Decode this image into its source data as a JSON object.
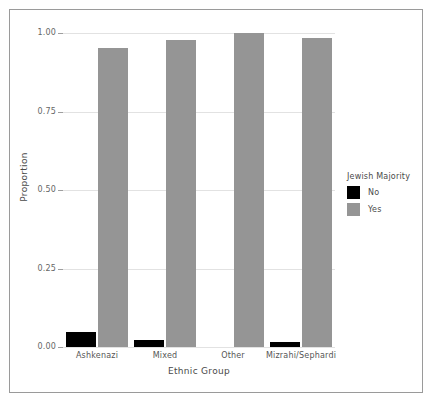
{
  "chart_data": {
    "type": "bar",
    "title": "",
    "subtitle": "",
    "xlabel": "Ethnic Group",
    "ylabel": "Proportion",
    "categories": [
      "Ashkenazi",
      "Mixed",
      "Other",
      "Mizrahi/Sephardi"
    ],
    "series": [
      {
        "name": "No",
        "color": "#000000",
        "values": [
          0.048,
          0.022,
          0.0,
          0.017
        ]
      },
      {
        "name": "Yes",
        "color": "#959595",
        "values": [
          0.952,
          0.978,
          1.0,
          0.983
        ]
      }
    ],
    "legend": {
      "title": "Jewish Majority",
      "position": "right",
      "entries": [
        {
          "label": "No",
          "color": "#000000"
        },
        {
          "label": "Yes",
          "color": "#959595"
        }
      ]
    },
    "ylim": [
      0,
      1
    ],
    "yticks": [
      0.0,
      0.25,
      0.5,
      0.75,
      1.0
    ],
    "ytick_labels": [
      "0.00",
      "0.25",
      "0.50",
      "0.75",
      "1.00"
    ],
    "grid": true,
    "grid_axis": "y",
    "bar_mode": "dodge"
  },
  "colors": {
    "frame_border": "#9a9a9a",
    "gridline": "#e2e2e2",
    "axis": "#b4b4b4",
    "text": "#4a4a4a",
    "tick_text": "#666666",
    "background": "#ffffff"
  }
}
